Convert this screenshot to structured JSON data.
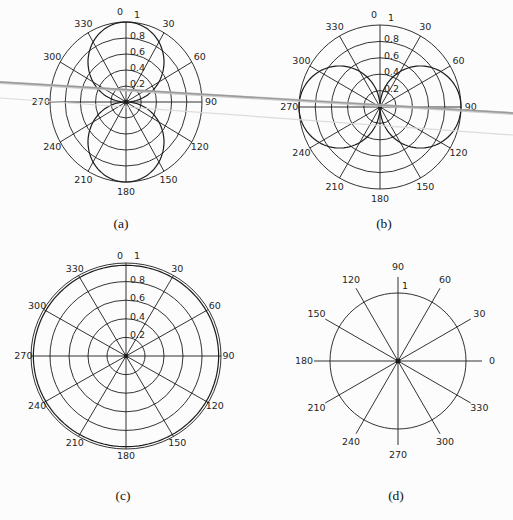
{
  "figure": {
    "background": "#fcfcfc",
    "line_color": "#1c1c1c",
    "artifact": {
      "description": "gray horizontal scan streaks across page",
      "dark_color": "#989898",
      "halo_color": "#c3c3c3",
      "light_color": "#d9d9d9"
    }
  },
  "chart_data": [
    {
      "id": "a",
      "type": "line",
      "plot_style": "polar",
      "caption": "(a)",
      "orientation": "0-at-top-clockwise",
      "angle_ticks_deg": [
        0,
        30,
        60,
        90,
        120,
        150,
        180,
        210,
        240,
        270,
        300,
        330
      ],
      "angle_tick_labels": [
        "0",
        "30",
        "60",
        "90",
        "120",
        "150",
        "180",
        "210",
        "240",
        "270",
        "300",
        "330"
      ],
      "radial_ticks": [
        0.2,
        0.4,
        0.6,
        0.8
      ],
      "radial_tick_labels": [
        "0.2",
        "0.4",
        "0.6",
        "0.8"
      ],
      "rmax_label": "1",
      "rlim": [
        0,
        1
      ],
      "grid": true,
      "series": [
        {
          "name": "two-lobe pattern (lobes at 0 and 180 deg)",
          "r_formula": "abs_cos",
          "theta_deg": [
            0,
            15,
            30,
            45,
            60,
            75,
            90,
            105,
            120,
            135,
            150,
            165,
            180,
            195,
            210,
            225,
            240,
            255,
            270,
            285,
            300,
            315,
            330,
            345
          ],
          "r": [
            1,
            0.966,
            0.866,
            0.707,
            0.5,
            0.259,
            0,
            0.259,
            0.5,
            0.707,
            0.866,
            0.966,
            1,
            0.966,
            0.866,
            0.707,
            0.5,
            0.259,
            0,
            0.259,
            0.5,
            0.707,
            0.866,
            0.966
          ]
        }
      ]
    },
    {
      "id": "b",
      "type": "line",
      "plot_style": "polar",
      "caption": "(b)",
      "orientation": "0-at-top-clockwise",
      "angle_ticks_deg": [
        0,
        30,
        60,
        90,
        120,
        150,
        180,
        210,
        240,
        270,
        300,
        330
      ],
      "angle_tick_labels": [
        "0",
        "30",
        "60",
        "90",
        "120",
        "150",
        "180",
        "210",
        "240",
        "270",
        "300",
        "330"
      ],
      "radial_ticks": [
        0.2,
        0.4,
        0.6,
        0.8
      ],
      "radial_tick_labels": [
        "0.2",
        "0.4",
        "0.6",
        "0.8"
      ],
      "rmax_label": "1",
      "rlim": [
        0,
        1
      ],
      "grid": true,
      "series": [
        {
          "name": "two-lobe pattern (lobes at 90 and 270 deg)",
          "r_formula": "abs_sin",
          "theta_deg": [
            0,
            15,
            30,
            45,
            60,
            75,
            90,
            105,
            120,
            135,
            150,
            165,
            180,
            195,
            210,
            225,
            240,
            255,
            270,
            285,
            300,
            315,
            330,
            345
          ],
          "r": [
            0,
            0.259,
            0.5,
            0.707,
            0.866,
            0.966,
            1,
            0.966,
            0.866,
            0.707,
            0.5,
            0.259,
            0,
            0.259,
            0.5,
            0.707,
            0.866,
            0.966,
            1,
            0.966,
            0.866,
            0.707,
            0.5,
            0.259
          ]
        }
      ]
    },
    {
      "id": "c",
      "type": "line",
      "plot_style": "polar",
      "caption": "(c)",
      "orientation": "0-at-top-clockwise",
      "angle_ticks_deg": [
        0,
        30,
        60,
        90,
        120,
        150,
        180,
        210,
        240,
        270,
        300,
        330
      ],
      "angle_tick_labels": [
        "0",
        "30",
        "60",
        "90",
        "120",
        "150",
        "180",
        "210",
        "240",
        "270",
        "300",
        "330"
      ],
      "radial_ticks": [
        0.2,
        0.4,
        0.6,
        0.8
      ],
      "radial_tick_labels": [
        "0.2",
        "0.4",
        "0.6",
        "0.8"
      ],
      "rmax_label": "1",
      "rlim": [
        0,
        1
      ],
      "grid": true,
      "series": [
        {
          "name": "omnidirectional pattern (near-unit circle)",
          "r_formula": "const",
          "r_value": 0.975,
          "theta_deg": [
            0,
            30,
            60,
            90,
            120,
            150,
            180,
            210,
            240,
            270,
            300,
            330
          ],
          "r": [
            0.975,
            0.975,
            0.975,
            0.975,
            0.975,
            0.975,
            0.975,
            0.975,
            0.975,
            0.975,
            0.975,
            0.975
          ]
        }
      ]
    },
    {
      "id": "d",
      "type": "line",
      "plot_style": "polar-grid",
      "caption": "(d)",
      "orientation": "0-at-right-counterclockwise",
      "angle_ticks_deg": [
        0,
        30,
        60,
        90,
        120,
        150,
        180,
        210,
        240,
        270,
        300,
        330
      ],
      "angle_tick_labels": [
        "0",
        "30",
        "60",
        "90",
        "120",
        "150",
        "180",
        "210",
        "240",
        "270",
        "300",
        "330"
      ],
      "radial_ticks": [
        1
      ],
      "radial_tick_labels": [
        "1"
      ],
      "rmax_label": "1",
      "rlim": [
        0,
        1
      ],
      "grid": true,
      "series": []
    }
  ]
}
